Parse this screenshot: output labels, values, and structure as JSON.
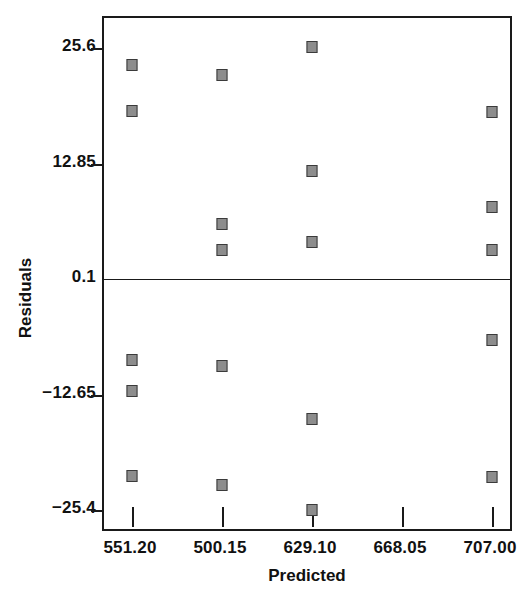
{
  "chart_data": {
    "type": "scatter",
    "title": "",
    "xlabel": "Predicted",
    "ylabel": "Residuals",
    "xtick_labels": [
      "551.20",
      "500.15",
      "629.10",
      "668.05",
      "707.00"
    ],
    "xtick_values": [
      551.2,
      500.15,
      629.1,
      668.05,
      707.0
    ],
    "ytick_labels": [
      "25.6",
      "12.85",
      "0.1",
      "-12.65",
      "-25.4"
    ],
    "ytick_values": [
      25.6,
      12.85,
      0.1,
      -12.65,
      -25.4
    ],
    "xlim": [
      540.2,
      717.8
    ],
    "ylim": [
      -29.2,
      30.0
    ],
    "grid": false,
    "legend": null,
    "zero_reference_line": 0.1,
    "marker": {
      "shape": "square",
      "fill": "#8d8d8d",
      "edge": "#3b3b3b",
      "size": 11
    },
    "points": [
      {
        "x": 551.2,
        "y": 23.7
      },
      {
        "x": 551.2,
        "y": 18.6
      },
      {
        "x": 551.2,
        "y": -8.8
      },
      {
        "x": 551.2,
        "y": -12.3
      },
      {
        "x": 551.2,
        "y": -21.7
      },
      {
        "x": 500.15,
        "y": 22.6
      },
      {
        "x": 500.15,
        "y": 6.2
      },
      {
        "x": 500.15,
        "y": 3.3
      },
      {
        "x": 500.15,
        "y": -9.5
      },
      {
        "x": 500.15,
        "y": -22.6
      },
      {
        "x": 629.1,
        "y": 25.7
      },
      {
        "x": 629.1,
        "y": 12.0
      },
      {
        "x": 629.1,
        "y": 4.2
      },
      {
        "x": 629.1,
        "y": -15.3
      },
      {
        "x": 629.1,
        "y": -25.4
      },
      {
        "x": 707.0,
        "y": 18.5
      },
      {
        "x": 707.0,
        "y": 8.1
      },
      {
        "x": 707.0,
        "y": 3.3
      },
      {
        "x": 707.0,
        "y": -6.6
      },
      {
        "x": 707.0,
        "y": -21.8
      }
    ]
  }
}
